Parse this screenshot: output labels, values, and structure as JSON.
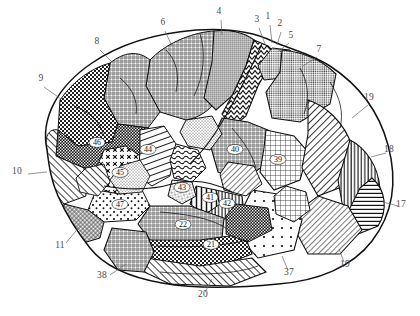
{
  "figure": {
    "caption": "",
    "style": "black-and-white engraved hatch-pattern anatomical plate",
    "view": "left lateral",
    "ink_color": "#111111",
    "paper_color": "#ffffff",
    "label_color": "#4a4a4a"
  },
  "perimeter_labels": [
    {
      "id": "lbl-6",
      "text": "6",
      "x": 163,
      "y": 25,
      "lx1": 165,
      "ly1": 31,
      "lx2": 172,
      "ly2": 46
    },
    {
      "id": "lbl-8",
      "text": "8",
      "x": 97,
      "y": 44,
      "lx1": 100,
      "ly1": 50,
      "lx2": 112,
      "ly2": 62
    },
    {
      "id": "lbl-9",
      "text": "9",
      "x": 41,
      "y": 81,
      "lx1": 44,
      "ly1": 87,
      "lx2": 61,
      "ly2": 99
    },
    {
      "id": "lbl-10",
      "text": "10",
      "x": 17,
      "y": 174,
      "lx1": 28,
      "ly1": 174,
      "lx2": 47,
      "ly2": 172
    },
    {
      "id": "lbl-11",
      "text": "11",
      "x": 60,
      "y": 248,
      "lx1": 66,
      "ly1": 243,
      "lx2": 80,
      "ly2": 226
    },
    {
      "id": "lbl-4",
      "text": "4",
      "x": 219,
      "y": 14,
      "lx1": 221,
      "ly1": 20,
      "lx2": 222,
      "ly2": 35
    },
    {
      "id": "lbl-3",
      "text": "3",
      "x": 257,
      "y": 22,
      "lx1": 259,
      "ly1": 28,
      "lx2": 265,
      "ly2": 44
    },
    {
      "id": "lbl-1",
      "text": "1",
      "x": 268,
      "y": 19,
      "lx1": 270,
      "ly1": 25,
      "lx2": 272,
      "ly2": 43
    },
    {
      "id": "lbl-2",
      "text": "2",
      "x": 280,
      "y": 26,
      "lx1": 281,
      "ly1": 32,
      "lx2": 277,
      "ly2": 45
    },
    {
      "id": "lbl-5",
      "text": "5",
      "x": 291,
      "y": 38,
      "lx1": 289,
      "ly1": 43,
      "lx2": 279,
      "ly2": 51
    },
    {
      "id": "lbl-7",
      "text": "7",
      "x": 319,
      "y": 52,
      "lx1": 317,
      "ly1": 57,
      "lx2": 303,
      "ly2": 66
    },
    {
      "id": "lbl-19a",
      "text": "19",
      "x": 369,
      "y": 100,
      "lx1": 368,
      "ly1": 105,
      "lx2": 352,
      "ly2": 118
    },
    {
      "id": "lbl-18",
      "text": "18",
      "x": 389,
      "y": 152,
      "lx1": 386,
      "ly1": 153,
      "lx2": 371,
      "ly2": 157
    },
    {
      "id": "lbl-17",
      "text": "17",
      "x": 401,
      "y": 207,
      "lx1": 398,
      "ly1": 206,
      "lx2": 383,
      "ly2": 202
    },
    {
      "id": "lbl-19b",
      "text": "19",
      "x": 345,
      "y": 267,
      "lx1": 344,
      "ly1": 262,
      "lx2": 339,
      "ly2": 249
    },
    {
      "id": "lbl-37",
      "text": "37",
      "x": 289,
      "y": 275,
      "lx1": 288,
      "ly1": 270,
      "lx2": 282,
      "ly2": 256
    },
    {
      "id": "lbl-20",
      "text": "20",
      "x": 203,
      "y": 297,
      "lx1": 205,
      "ly1": 292,
      "lx2": 212,
      "ly2": 279
    },
    {
      "id": "lbl-38",
      "text": "38",
      "x": 102,
      "y": 278,
      "lx1": 110,
      "ly1": 275,
      "lx2": 126,
      "ly2": 264
    }
  ],
  "region_numbers": [
    {
      "id": "reg-46",
      "text": "46",
      "x": 97,
      "y": 145
    },
    {
      "id": "reg-45",
      "text": "45",
      "x": 120,
      "y": 175
    },
    {
      "id": "reg-47",
      "text": "47",
      "x": 120,
      "y": 207
    },
    {
      "id": "reg-44",
      "text": "44",
      "x": 148,
      "y": 152
    },
    {
      "id": "reg-43",
      "text": "43",
      "x": 182,
      "y": 190
    },
    {
      "id": "reg-41",
      "text": "41",
      "x": 210,
      "y": 200
    },
    {
      "id": "reg-42",
      "text": "42",
      "x": 227,
      "y": 206
    },
    {
      "id": "reg-22",
      "text": "22",
      "x": 183,
      "y": 227
    },
    {
      "id": "reg-21",
      "text": "21",
      "x": 211,
      "y": 247
    },
    {
      "id": "reg-40",
      "text": "40",
      "x": 235,
      "y": 152
    },
    {
      "id": "reg-39",
      "text": "39",
      "x": 278,
      "y": 162
    }
  ],
  "legend": {
    "description": "Each numbered field is rendered with a distinct engraving texture: cross-hatch, stipple, dots, dense checker, parallel hatch, vertical rule and wavy line fills."
  }
}
